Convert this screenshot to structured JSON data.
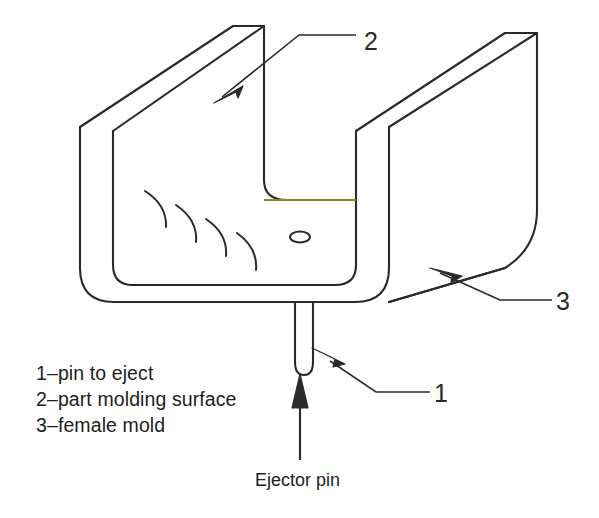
{
  "figure": {
    "type": "isometric-technical-drawing",
    "stroke_color": "#2b2a28",
    "accent_line_color": "#8a8a28",
    "background": "#ffffff"
  },
  "callouts": {
    "label_1": "1",
    "label_2": "2",
    "label_3": "3"
  },
  "legend": {
    "line_1": "1–pin to eject",
    "line_2": "2–part molding surface",
    "line_3": "3–female mold"
  },
  "caption": {
    "text": "Ejector pin"
  },
  "parts": {
    "pin_name": "ejector-pin",
    "cavity_name": "part-molding-surface",
    "mold_name": "female-mold",
    "pin_hole_name": "ejector-pin-hole"
  }
}
